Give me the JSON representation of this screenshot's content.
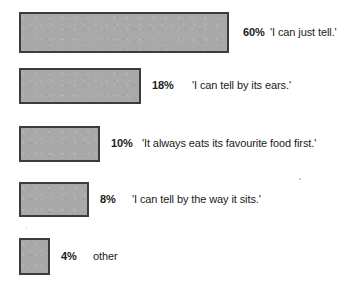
{
  "chart_data": {
    "type": "bar",
    "orientation": "horizontal",
    "title": "",
    "subtitle": "",
    "xlabel": "",
    "ylabel": "",
    "grid": false,
    "legend": "none",
    "axis_visible": false,
    "value_suffix": "%",
    "xlim": [
      0,
      60
    ],
    "categories": [
      "'I can just tell.'",
      "'I can tell by its ears.'",
      "'It always eats its favourite food first.'",
      "'I can tell by the way it sits.'",
      "other"
    ],
    "values": [
      60,
      18,
      10,
      8,
      4
    ],
    "value_labels": [
      "60%",
      "18%",
      "10%",
      "8%",
      "4%"
    ],
    "colors": {
      "bar_fill": "#a9a9a9",
      "bar_border": "#3c3c3c",
      "text": "#1b1b1b",
      "background": "#ffffff"
    },
    "bars": [
      {
        "value": 60,
        "value_label": "60%",
        "category": "'I can just tell.'",
        "geometry": {
          "x": 19,
          "y": 12,
          "width": 210,
          "height": 41
        },
        "value_label_x": 243,
        "category_label_x": 270
      },
      {
        "value": 18,
        "value_label": "18%",
        "category": "'I can tell by its ears.'",
        "geometry": {
          "x": 19,
          "y": 68,
          "width": 122,
          "height": 36
        },
        "value_label_x": 152,
        "category_label_x": 192
      },
      {
        "value": 10,
        "value_label": "10%",
        "category": "'It always eats its favourite food first.'",
        "geometry": {
          "x": 19,
          "y": 126,
          "width": 81,
          "height": 36
        },
        "value_label_x": 111,
        "category_label_x": 142
      },
      {
        "value": 8,
        "value_label": "8%",
        "category": "'I can tell by the way it sits.'",
        "geometry": {
          "x": 19,
          "y": 182,
          "width": 70,
          "height": 35
        },
        "value_label_x": 100,
        "category_label_x": 132
      },
      {
        "value": 4,
        "value_label": "4%",
        "category": "other",
        "geometry": {
          "x": 19,
          "y": 238,
          "width": 31,
          "height": 37
        },
        "value_label_x": 61,
        "category_label_x": 93
      }
    ]
  }
}
